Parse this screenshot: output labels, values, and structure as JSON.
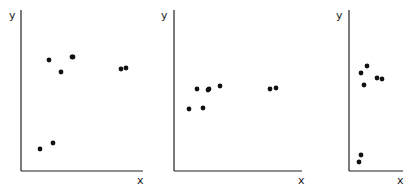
{
  "chart_data": [
    {
      "type": "scatter",
      "title": "",
      "xlabel": "x",
      "ylabel": "y",
      "grid": false,
      "legend": null,
      "ticks": "none",
      "frame": {
        "x0": 21,
        "y0": 171,
        "x1": 143,
        "ytop": 10
      },
      "points_px": [
        [
          49,
          60
        ],
        [
          61,
          72
        ],
        [
          72,
          57
        ],
        [
          73,
          57
        ],
        [
          121,
          69
        ],
        [
          126,
          68
        ],
        [
          40,
          149
        ],
        [
          53,
          143
        ]
      ],
      "points_rel": [
        [
          0.23,
          0.69
        ],
        [
          0.33,
          0.61
        ],
        [
          0.42,
          0.71
        ],
        [
          0.43,
          0.71
        ],
        [
          0.82,
          0.63
        ],
        [
          0.86,
          0.64
        ],
        [
          0.16,
          0.14
        ],
        [
          0.26,
          0.17
        ]
      ]
    },
    {
      "type": "scatter",
      "title": "",
      "xlabel": "x",
      "ylabel": "y",
      "grid": false,
      "legend": null,
      "ticks": "none",
      "frame": {
        "x0": 174,
        "y0": 171,
        "x1": 302,
        "ytop": 10
      },
      "points_px": [
        [
          197,
          89
        ],
        [
          208,
          90
        ],
        [
          209,
          89
        ],
        [
          220,
          86
        ],
        [
          189,
          109
        ],
        [
          203,
          108
        ],
        [
          270,
          89
        ],
        [
          276,
          88
        ]
      ],
      "points_rel": [
        [
          0.18,
          0.51
        ],
        [
          0.27,
          0.5
        ],
        [
          0.27,
          0.51
        ],
        [
          0.36,
          0.53
        ],
        [
          0.12,
          0.39
        ],
        [
          0.23,
          0.39
        ],
        [
          0.75,
          0.51
        ],
        [
          0.8,
          0.52
        ]
      ]
    },
    {
      "type": "scatter",
      "title": "",
      "xlabel": "x",
      "ylabel": "y",
      "grid": false,
      "legend": null,
      "ticks": "none",
      "frame": {
        "x0": 349,
        "y0": 171,
        "x1": 403,
        "ytop": 10
      },
      "points_px": [
        [
          367,
          66
        ],
        [
          361,
          73
        ],
        [
          377,
          78
        ],
        [
          382,
          79
        ],
        [
          364,
          85
        ],
        [
          361,
          155
        ],
        [
          359,
          162
        ]
      ],
      "points_rel": [
        [
          0.33,
          0.65
        ],
        [
          0.22,
          0.61
        ],
        [
          0.52,
          0.58
        ],
        [
          0.61,
          0.57
        ],
        [
          0.28,
          0.53
        ],
        [
          0.22,
          0.1
        ],
        [
          0.19,
          0.06
        ]
      ]
    }
  ],
  "style": {
    "axis_color": "#222222",
    "point_color": "#111111",
    "background": "#ffffff"
  }
}
